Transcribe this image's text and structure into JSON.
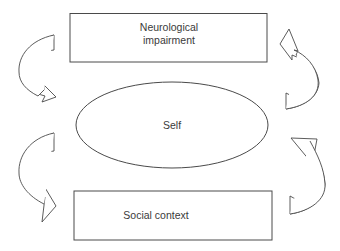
{
  "diagram": {
    "nodes": [
      {
        "id": "neurological-impairment",
        "shape": "rectangle",
        "lines": [
          "Neurological",
          "impairment"
        ]
      },
      {
        "id": "self",
        "shape": "ellipse",
        "lines": [
          "Self"
        ]
      },
      {
        "id": "social-context",
        "shape": "rectangle",
        "lines": [
          "Social context"
        ]
      }
    ],
    "arrows": [
      {
        "id": "left-upper",
        "side": "left",
        "from": "neurological-impairment",
        "to": "self",
        "direction": "down"
      },
      {
        "id": "left-lower",
        "side": "left",
        "from": "self",
        "to": "social-context",
        "direction": "down"
      },
      {
        "id": "right-lower",
        "side": "right",
        "from": "social-context",
        "to": "self",
        "direction": "up"
      },
      {
        "id": "right-upper",
        "side": "right",
        "from": "self",
        "to": "neurological-impairment",
        "direction": "up"
      }
    ],
    "colors": {
      "stroke": "#4a4a4a",
      "text": "#3a3a3a",
      "background": "#ffffff"
    }
  }
}
